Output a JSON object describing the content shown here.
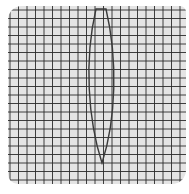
{
  "diagram": {
    "type": "lens-on-grid",
    "colors": {
      "paper": "#e4e4e4",
      "grid_line": "#2a2a2a",
      "lens_outline": "#3a3a3a"
    },
    "grid": {
      "columns": 21,
      "rows": 21,
      "cell_px": 8.5
    },
    "lens": {
      "shape": "biconvex",
      "top_flat_x": [
        96,
        106
      ],
      "top_y": 9,
      "bottom_point": [
        102,
        163
      ],
      "max_half_width_px": 14
    }
  }
}
